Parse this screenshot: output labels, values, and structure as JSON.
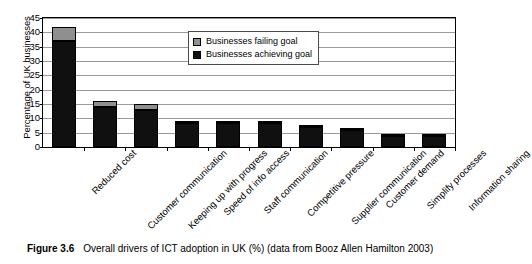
{
  "figure": {
    "caption_label": "Figure 3.6",
    "caption_text": "Overall drivers of ICT adoption in UK (%) (data from Booz Allen Hamilton 2003)"
  },
  "colors": {
    "achieving": "#101010",
    "failing": "#8f8f8f",
    "gridline": "#9a9a9a",
    "axis": "#000000",
    "background": "#ffffff"
  },
  "chart_data": {
    "type": "bar",
    "stacked": true,
    "title": "",
    "xlabel": "",
    "ylabel": "Percentage of UK businesses",
    "ylim": [
      0,
      45
    ],
    "yticks": [
      0,
      5,
      10,
      15,
      20,
      25,
      30,
      35,
      40,
      45
    ],
    "grid": true,
    "legend_position": "inside-top-center",
    "categories": [
      "Reduced cost",
      "Customer communication",
      "Keeping up with progress",
      "Speed of info access",
      "Staff communication",
      "Competitive pressure",
      "Supplier communication",
      "Customer demand",
      "Simplify processes",
      "Information sharing"
    ],
    "series": [
      {
        "name": "Businesses achieving goal",
        "color": "#101010",
        "values": [
          37,
          14,
          13,
          8.5,
          8.5,
          8.5,
          7,
          6,
          4,
          4
        ]
      },
      {
        "name": "Businesses failing goal",
        "color": "#8f8f8f",
        "values": [
          5,
          2,
          2,
          0.5,
          0.5,
          0.5,
          0.7,
          0.6,
          0.5,
          0.5
        ]
      }
    ],
    "totals": [
      42,
      16,
      15,
      9,
      9,
      9,
      7.7,
      6.6,
      4.5,
      4.5
    ]
  }
}
